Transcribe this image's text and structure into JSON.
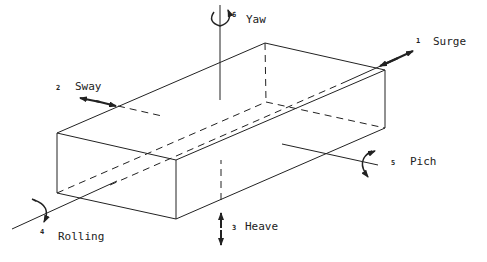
{
  "figure": {
    "motions": [
      {
        "number": "1",
        "label": "Surge",
        "type": "translation"
      },
      {
        "number": "2",
        "label": "Sway",
        "type": "translation"
      },
      {
        "number": "3",
        "label": "Heave",
        "type": "translation"
      },
      {
        "number": "4",
        "label": "Rolling",
        "type": "rotation"
      },
      {
        "number": "5",
        "label": "Pich",
        "type": "rotation"
      },
      {
        "number": "6",
        "label": "Yaw",
        "type": "rotation"
      }
    ]
  }
}
